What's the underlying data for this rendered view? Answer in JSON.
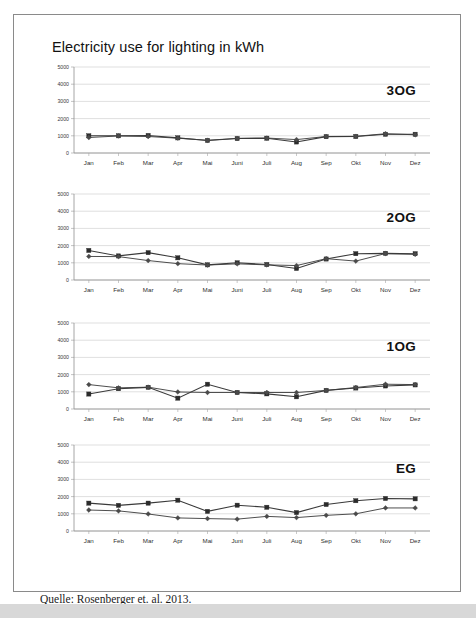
{
  "figure": {
    "title": "Electricity use for lighting in kWh",
    "source_caption": "Quelle: Rosenberger et. al. 2013."
  },
  "chart_data": [
    {
      "type": "line",
      "title": "3OG",
      "xlabel": "",
      "ylabel": "",
      "ylim": [
        0,
        5000
      ],
      "yticks": [
        0,
        1000,
        2000,
        3000,
        4000,
        5000
      ],
      "grid": true,
      "legend": "none",
      "categories": [
        "Jan",
        "Feb",
        "Mar",
        "Apr",
        "Mai",
        "Juni",
        "Juli",
        "Aug",
        "Sep",
        "Okt",
        "Nov",
        "Dez"
      ],
      "series": [
        {
          "name": "series-square",
          "marker": "square",
          "values": [
            1000,
            1000,
            1020,
            880,
            730,
            840,
            860,
            640,
            950,
            960,
            1090,
            1090
          ]
        },
        {
          "name": "series-diamond",
          "marker": "diamond",
          "values": [
            900,
            990,
            960,
            860,
            740,
            850,
            870,
            780,
            960,
            970,
            1120,
            1060
          ]
        }
      ]
    },
    {
      "type": "line",
      "title": "2OG",
      "xlabel": "",
      "ylabel": "",
      "ylim": [
        0,
        5000
      ],
      "yticks": [
        0,
        1000,
        2000,
        3000,
        4000,
        5000
      ],
      "grid": true,
      "legend": "none",
      "categories": [
        "Jan",
        "Feb",
        "Mar",
        "Apr",
        "Mai",
        "Juni",
        "Juli",
        "Aug",
        "Sep",
        "Okt",
        "Nov",
        "Dez"
      ],
      "series": [
        {
          "name": "series-square",
          "marker": "square",
          "values": [
            1720,
            1400,
            1590,
            1290,
            880,
            1000,
            900,
            670,
            1220,
            1530,
            1550,
            1530
          ]
        },
        {
          "name": "series-diamond",
          "marker": "diamond",
          "values": [
            1370,
            1360,
            1130,
            950,
            870,
            940,
            880,
            840,
            1240,
            1100,
            1540,
            1490
          ]
        }
      ]
    },
    {
      "type": "line",
      "title": "1OG",
      "xlabel": "",
      "ylabel": "",
      "ylim": [
        0,
        5000
      ],
      "yticks": [
        0,
        1000,
        2000,
        3000,
        4000,
        5000
      ],
      "grid": true,
      "legend": "none",
      "categories": [
        "Jan",
        "Feb",
        "Mar",
        "Apr",
        "Mai",
        "Juni",
        "Juli",
        "Aug",
        "Sep",
        "Okt",
        "Nov",
        "Dez"
      ],
      "series": [
        {
          "name": "series-square",
          "marker": "square",
          "values": [
            870,
            1180,
            1260,
            630,
            1440,
            960,
            880,
            710,
            1080,
            1220,
            1340,
            1400
          ]
        },
        {
          "name": "series-diamond",
          "marker": "diamond",
          "values": [
            1420,
            1230,
            1270,
            990,
            960,
            960,
            960,
            960,
            1080,
            1250,
            1440,
            1420
          ]
        }
      ]
    },
    {
      "type": "line",
      "title": "EG",
      "xlabel": "",
      "ylabel": "",
      "ylim": [
        0,
        5000
      ],
      "yticks": [
        0,
        1000,
        2000,
        3000,
        4000,
        5000
      ],
      "grid": true,
      "legend": "none",
      "categories": [
        "Jan",
        "Feb",
        "Mar",
        "Apr",
        "Mai",
        "Juni",
        "Juli",
        "Aug",
        "Sep",
        "Okt",
        "Nov",
        "Dez"
      ],
      "series": [
        {
          "name": "series-square",
          "marker": "square",
          "values": [
            1620,
            1490,
            1620,
            1790,
            1140,
            1500,
            1380,
            1070,
            1540,
            1760,
            1890,
            1870
          ]
        },
        {
          "name": "series-diamond",
          "marker": "diamond",
          "values": [
            1220,
            1170,
            990,
            760,
            720,
            690,
            850,
            780,
            910,
            1000,
            1340,
            1340
          ]
        }
      ]
    }
  ]
}
